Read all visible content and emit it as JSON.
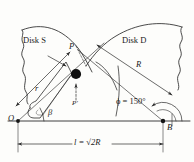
{
  "figure": {
    "stroke_color": "#2b2b2b",
    "fill_color": "#111111",
    "background": "#fdfdfb"
  },
  "labels": {
    "disk_s": "Disk S",
    "disk_d": "Disk D",
    "point_p": "P",
    "point_p_prime": "P′",
    "origin_o": "O",
    "point_b": "B",
    "radius_r_small": "r",
    "radius_r_large": "R",
    "angle_beta": "β",
    "angle_phi": "ϕ = 150°",
    "length_l": "l = √2R"
  },
  "geometry": {
    "origin_o": {
      "x": 18,
      "y": 121
    },
    "point_b": {
      "x": 163,
      "y": 121
    },
    "point_p": {
      "x": 75,
      "y": 75
    },
    "arc_radius_R": 100,
    "angle_phi_degrees": 150,
    "baseline_y": 121,
    "separation_label": "√2R"
  },
  "annotations": {
    "arrow_count": 8,
    "dimension_lines": [
      "r",
      "R",
      "l = √2R"
    ],
    "angles_marked": [
      "β",
      "ϕ = 150°"
    ]
  }
}
